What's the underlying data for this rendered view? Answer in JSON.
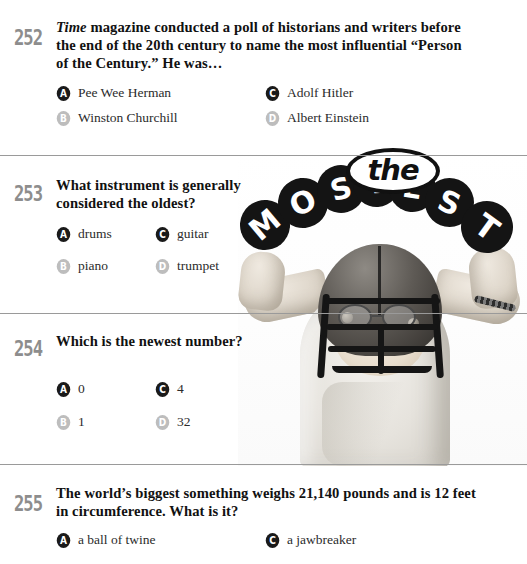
{
  "logo": {
    "the": "the",
    "mostest": "MOSTEST",
    "letters": [
      "M",
      "O",
      "S",
      "T",
      "E",
      "S",
      "T"
    ]
  },
  "photo": {
    "alt": "boy wearing football helmet flexing arms"
  },
  "questions": [
    {
      "number": "252",
      "text_html": "<em>Time</em> magazine conducted a poll of historians and writers before the end of the 20th century to name the most influential &ldquo;Person of the Century.&rdquo; He was&hellip;",
      "text_plain": "Time magazine conducted a poll of historians and writers before the end of the 20th century to name the most influential “Person of the Century.” He was…",
      "options": [
        {
          "key": "A",
          "label": "Pee Wee Herman",
          "style": "dark"
        },
        {
          "key": "B",
          "label": "Winston Churchill",
          "style": "light"
        },
        {
          "key": "C",
          "label": "Adolf Hitler",
          "style": "dark"
        },
        {
          "key": "D",
          "label": "Albert Einstein",
          "style": "light"
        }
      ]
    },
    {
      "number": "253",
      "text_html": "What instrument is generally considered the oldest?",
      "text_plain": "What instrument is generally considered the oldest?",
      "options": [
        {
          "key": "A",
          "label": "drums",
          "style": "dark"
        },
        {
          "key": "B",
          "label": "piano",
          "style": "light"
        },
        {
          "key": "C",
          "label": "guitar",
          "style": "dark"
        },
        {
          "key": "D",
          "label": "trumpet",
          "style": "light"
        }
      ]
    },
    {
      "number": "254",
      "text_html": "Which is the newest number?",
      "text_plain": "Which is the newest number?",
      "options": [
        {
          "key": "A",
          "label": "0",
          "style": "dark"
        },
        {
          "key": "B",
          "label": "1",
          "style": "light"
        },
        {
          "key": "C",
          "label": "4",
          "style": "dark"
        },
        {
          "key": "D",
          "label": "32",
          "style": "light"
        }
      ]
    },
    {
      "number": "255",
      "text_html": "The world&rsquo;s biggest something weighs 21,140 pounds and is 12 feet in circumference. What is it?",
      "text_plain": "The world’s biggest something weighs 21,140 pounds and is 12 feet in circumference. What is it?",
      "options": [
        {
          "key": "A",
          "label": "a ball of twine",
          "style": "dark"
        },
        {
          "key": "C",
          "label": "a jawbreaker",
          "style": "dark"
        }
      ]
    }
  ],
  "colors": {
    "ink": "#111111",
    "number_gray": "#8d8d8d",
    "bullet_dark": "#1a1a1a",
    "bullet_light": "#bdbdbd",
    "rule": "#9a9a9a",
    "page_bg": "#ffffff"
  }
}
